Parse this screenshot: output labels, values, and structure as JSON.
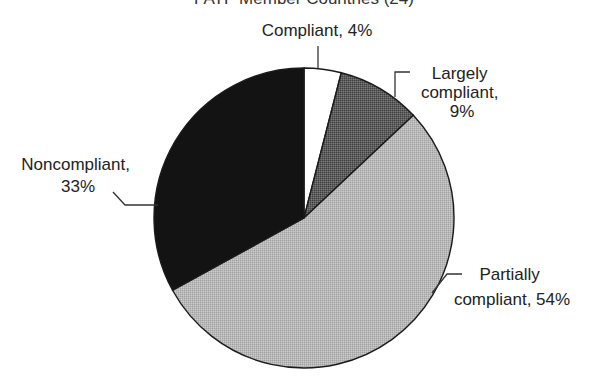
{
  "chart_data": {
    "type": "pie",
    "title": "FATF Member Countries (24)",
    "start_angle": "12 o'clock",
    "direction": "clockwise",
    "slices": [
      {
        "label": "Compliant",
        "value": 4,
        "display": [
          "Compliant, 4%"
        ],
        "color": "#ffffff"
      },
      {
        "label": "Largely compliant",
        "value": 9,
        "display": [
          "Largely",
          "compliant,",
          "9%"
        ],
        "color": "#5e5e5e"
      },
      {
        "label": "Partially compliant",
        "value": 54,
        "display": [
          "Partially",
          "compliant, 54%"
        ],
        "color": "#b8b8b8"
      },
      {
        "label": "Noncompliant",
        "value": 33,
        "display": [
          "Noncompliant,",
          "33%"
        ],
        "color": "#131313"
      }
    ],
    "unit": "%",
    "legend": "none (direct labels with leader lines)"
  }
}
